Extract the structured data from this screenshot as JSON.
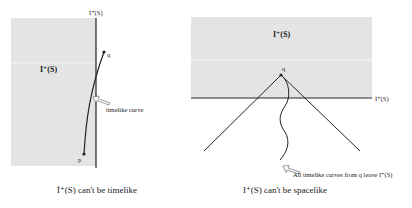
{
  "left_panel": {
    "region_label": "I⁺(S)",
    "boundary_label": "İ⁺(S)",
    "point_q": "q",
    "point_p": "p",
    "curve_label": "timelike curve",
    "caption": "İ⁺(S) can't be timelike"
  },
  "right_panel": {
    "region_label": "I⁺(S)",
    "boundary_label": "İ⁺(S)",
    "point_q": "q",
    "curve_label": "All timelike curves from q leave I⁺(S)",
    "caption": "I⁺(S) can't be spacelike"
  },
  "colors": {
    "shaded_region": "#e4e4e4",
    "line": "#222222",
    "background": "#ffffff"
  }
}
